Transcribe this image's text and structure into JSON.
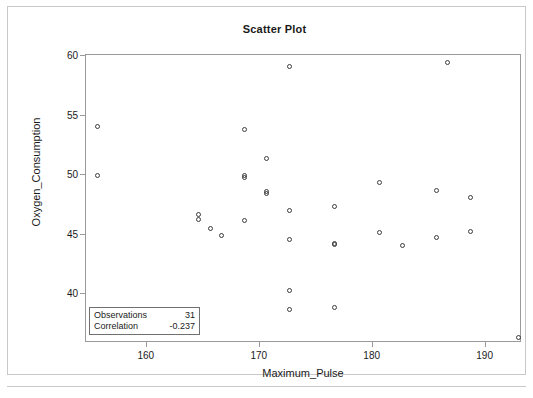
{
  "chart_data": {
    "type": "scatter",
    "title": "Scatter Plot",
    "xlabel": "Maximum_Pulse",
    "ylabel": "Oxygen_Consumption",
    "xlim": [
      154.0,
      192.6
    ],
    "ylim": [
      36.4,
      60.6
    ],
    "xticks": [
      160,
      170,
      180,
      190
    ],
    "yticks": [
      40,
      45,
      50,
      55,
      60
    ],
    "grid": false,
    "legend": null,
    "marker": "open-circle",
    "marker_color": "#3c3c3c",
    "points": [
      {
        "x": 155.0,
        "y": 54.6
      },
      {
        "x": 155.0,
        "y": 50.5
      },
      {
        "x": 164.0,
        "y": 47.2
      },
      {
        "x": 164.0,
        "y": 46.8
      },
      {
        "x": 165.0,
        "y": 46.0
      },
      {
        "x": 166.0,
        "y": 45.4
      },
      {
        "x": 168.0,
        "y": 54.3
      },
      {
        "x": 168.0,
        "y": 50.5
      },
      {
        "x": 168.0,
        "y": 50.3
      },
      {
        "x": 168.0,
        "y": 46.7
      },
      {
        "x": 170.0,
        "y": 51.9
      },
      {
        "x": 170.0,
        "y": 49.1
      },
      {
        "x": 170.0,
        "y": 49.0
      },
      {
        "x": 172.0,
        "y": 59.6
      },
      {
        "x": 172.0,
        "y": 47.5
      },
      {
        "x": 172.0,
        "y": 45.1
      },
      {
        "x": 172.0,
        "y": 40.8
      },
      {
        "x": 172.0,
        "y": 39.2
      },
      {
        "x": 176.0,
        "y": 47.9
      },
      {
        "x": 176.0,
        "y": 44.8
      },
      {
        "x": 176.0,
        "y": 44.7
      },
      {
        "x": 176.0,
        "y": 39.4
      },
      {
        "x": 180.0,
        "y": 49.9
      },
      {
        "x": 180.0,
        "y": 45.7
      },
      {
        "x": 182.0,
        "y": 44.6
      },
      {
        "x": 185.0,
        "y": 49.2
      },
      {
        "x": 185.0,
        "y": 45.3
      },
      {
        "x": 186.0,
        "y": 60.0
      },
      {
        "x": 188.0,
        "y": 48.6
      },
      {
        "x": 188.0,
        "y": 45.8
      },
      {
        "x": 192.3,
        "y": 36.9
      }
    ],
    "annotations": {
      "observations_label": "Observations",
      "observations_value": "31",
      "correlation_label": "Correlation",
      "correlation_value": "-0.237"
    }
  }
}
